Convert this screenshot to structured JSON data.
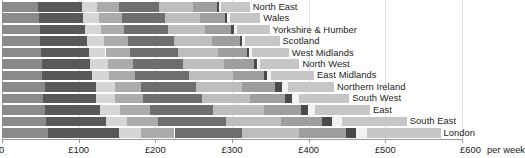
{
  "chart_data": {
    "type": "bar",
    "orientation": "horizontal",
    "stacked": true,
    "title": "",
    "subtitle": "",
    "xlabel": "£ per week",
    "ylabel": "",
    "xlim": [
      0,
      600
    ],
    "grid": true,
    "legend_position": "none",
    "axis_unit_label": "per week",
    "xticks": [
      0,
      100,
      200,
      300,
      400,
      500,
      600
    ],
    "xtick_labels": [
      "0",
      "£100",
      "£200",
      "£300",
      "£400",
      "£500",
      "£600"
    ],
    "categories": [
      "North East",
      "Wales",
      "Yorkshire & Humber",
      "Scotland",
      "West Midlands",
      "North West",
      "East Midlands",
      "Northern Ireland",
      "South West",
      "East",
      "South East",
      "London"
    ],
    "series": [
      {
        "name": "Food & non-alcoholic drinks",
        "color": "#8a8a8a",
        "values": [
          47,
          48,
          49,
          50,
          51,
          52,
          52,
          56,
          53,
          56,
          58,
          60
        ]
      },
      {
        "name": "Housing, fuel & power",
        "color": "#585858",
        "values": [
          57,
          58,
          59,
          61,
          62,
          63,
          65,
          66,
          70,
          72,
          78,
          92
        ]
      },
      {
        "name": "Clothing & footwear",
        "color": "#d6d6d6",
        "values": [
          20,
          21,
          21,
          22,
          22,
          23,
          23,
          26,
          24,
          26,
          27,
          29
        ]
      },
      {
        "name": "Household goods & services",
        "color": "#ababab",
        "values": [
          28,
          29,
          30,
          31,
          32,
          33,
          34,
          33,
          37,
          39,
          41,
          44
        ]
      },
      {
        "name": "Transport",
        "color": "#6e6e6e",
        "values": [
          53,
          56,
          58,
          60,
          63,
          65,
          70,
          72,
          77,
          82,
          88,
          88
        ]
      },
      {
        "name": "Recreation & culture",
        "color": "#bdbdbd",
        "values": [
          44,
          46,
          48,
          50,
          52,
          54,
          57,
          60,
          63,
          67,
          72,
          74
        ]
      },
      {
        "name": "Restaurants & hotels",
        "color": "#9e9e9e",
        "values": [
          31,
          33,
          34,
          36,
          37,
          39,
          41,
          43,
          45,
          48,
          53,
          62
        ]
      },
      {
        "name": "Alcohol & tobacco",
        "color": "#4a4a4a",
        "values": [
          3,
          3,
          3,
          3,
          3,
          4,
          4,
          9,
          9,
          9,
          14,
          13
        ]
      },
      {
        "name": "Education",
        "color": "#f2f2f2",
        "values": [
          3,
          3,
          4,
          4,
          4,
          4,
          5,
          8,
          9,
          9,
          12,
          14
        ]
      },
      {
        "name": "Other expenditure",
        "color": "#c6c6c6",
        "values": [
          37,
          40,
          43,
          45,
          48,
          51,
          56,
          60,
          66,
          72,
          85,
          96
        ]
      }
    ],
    "totals": [
      323,
      337,
      349,
      362,
      374,
      388,
      407,
      433,
      453,
      480,
      528,
      572
    ]
  },
  "axis": {
    "unit_suffix": "per week",
    "tick_labels": [
      "0",
      "£100",
      "£200",
      "£300",
      "£400",
      "£500",
      "£600"
    ]
  },
  "colors": {
    "background": "#ffffff",
    "text": "#1b1b1b",
    "axis": "#9a9a9a",
    "grid": "#c9c9c9"
  }
}
